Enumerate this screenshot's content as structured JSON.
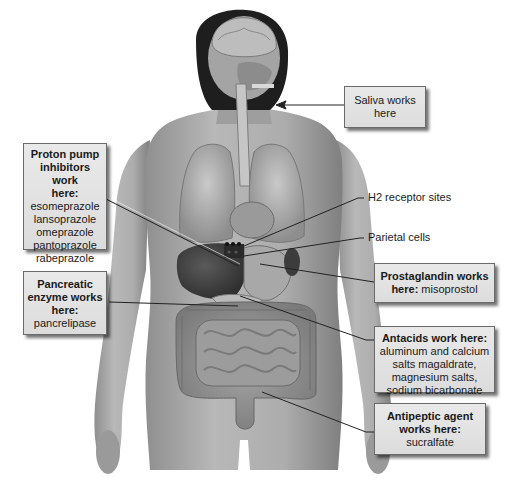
{
  "diagram": {
    "callouts": {
      "saliva": {
        "title": "Saliva works here",
        "lines": [
          "Saliva works",
          "here"
        ]
      },
      "ppi": {
        "title_lines": [
          "Proton pump",
          "inhibitors work",
          "here:"
        ],
        "drugs": [
          "esomeprazole",
          "lansoprazole",
          "omeprazole",
          "pantoprazole",
          "rabeprazole"
        ]
      },
      "pancreatic": {
        "title_lines": [
          "Pancreatic",
          "enzyme works",
          "here:"
        ],
        "drugs": [
          "pancrelipase"
        ]
      },
      "prostaglandin": {
        "title_lines": [
          "Prostaglandin works"
        ],
        "title_inline": "here:",
        "drugs": [
          "misoprostol"
        ]
      },
      "antacids": {
        "title_lines": [
          "Antacids work here:"
        ],
        "drugs": [
          "aluminum and calcium",
          "salts magaldrate,",
          "magnesium salts,",
          "sodium bicarbonate"
        ]
      },
      "antipeptic": {
        "title_lines": [
          "Antipeptic agent",
          "works here:"
        ],
        "drugs": [
          "sucralfate"
        ]
      }
    },
    "plain_labels": {
      "h2": "H2 receptor sites",
      "parietal": "Parietal cells"
    },
    "colors": {
      "box_fill": "#e3e3e3",
      "box_border": "#6a6a6a",
      "leader_line": "#222222",
      "figure_skin": "#a9a9a9",
      "hair": "#1e1e1e"
    }
  }
}
